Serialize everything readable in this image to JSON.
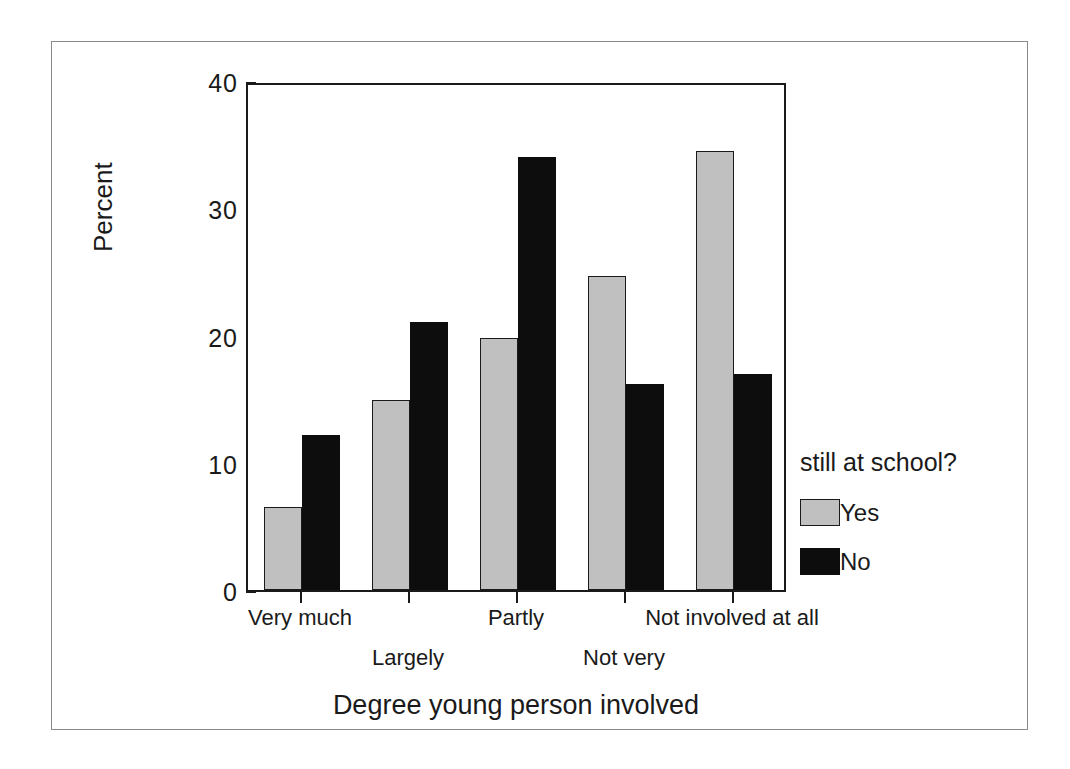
{
  "chart_data": {
    "type": "bar",
    "title": "",
    "xlabel": "Degree young person involved",
    "ylabel": "Percent",
    "ylim": [
      0,
      40
    ],
    "yticks": [
      "0",
      "10",
      "20",
      "30",
      "40"
    ],
    "ytick_values": [
      0,
      10,
      20,
      30,
      40
    ],
    "grid": false,
    "legend_position": "right",
    "legend_title": "still at school?",
    "categories": [
      "Very much",
      "Largely",
      "Partly",
      "Not very",
      "Not involved at all"
    ],
    "series": [
      {
        "name": "Yes",
        "color": "#c0c0c0",
        "values": [
          6.5,
          14.9,
          19.8,
          24.7,
          34.5
        ]
      },
      {
        "name": "No",
        "color": "#0d0d0d",
        "values": [
          12.2,
          21.1,
          34.0,
          16.2,
          17.0
        ]
      }
    ]
  },
  "axes": {
    "y_title": "Percent",
    "x_title": "Degree young person involved"
  },
  "legend": {
    "title": "still at school?",
    "entries": [
      {
        "label": "Yes",
        "swatch": "gray"
      },
      {
        "label": "No",
        "swatch": "black"
      }
    ]
  },
  "colors": {
    "series_yes": "#c0c0c0",
    "series_no": "#0d0d0d",
    "axis": "#1a1a1a",
    "page_border": "#8a8a8a",
    "background": "#ffffff"
  }
}
